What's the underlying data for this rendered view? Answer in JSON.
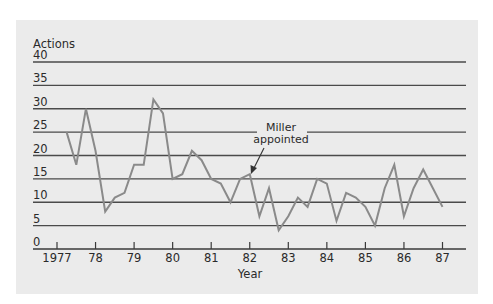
{
  "chart_data": {
    "type": "line",
    "title": "",
    "xlabel": "Year",
    "ylabel": "Actions",
    "ylim": [
      0,
      40
    ],
    "yticks": [
      0,
      5,
      10,
      15,
      20,
      25,
      30,
      35,
      40
    ],
    "xticks": [
      "1977",
      "78",
      "79",
      "80",
      "81",
      "82",
      "83",
      "84",
      "85",
      "86",
      "87"
    ],
    "grid": true,
    "legend": null,
    "x_start": 1977.25,
    "x_step": 0.25,
    "series": [
      {
        "name": "Actions",
        "color": "#8a8a8a",
        "values": [
          25,
          18,
          30,
          21,
          8,
          11,
          12,
          18,
          18,
          32,
          29,
          15,
          16,
          21,
          19,
          15,
          14,
          10,
          15,
          16,
          7,
          13,
          4,
          7,
          11,
          9,
          15,
          14,
          6,
          12,
          11,
          9,
          5,
          13,
          18,
          7,
          13,
          17,
          13,
          9
        ]
      }
    ],
    "annotations": [
      {
        "text_line1": "Miller",
        "text_line2": "appointed",
        "x": 1982.0,
        "y": 16
      }
    ]
  },
  "colors": {
    "panel": "#ebebeb",
    "grid": "#4a4a4a",
    "series": "#8a8a8a"
  }
}
